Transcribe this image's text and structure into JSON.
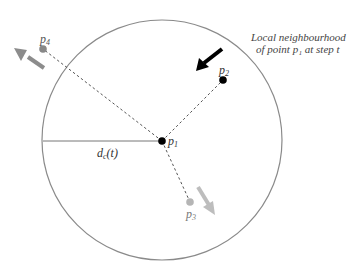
{
  "diagram": {
    "caption_lines": [
      "Local neighbourhood",
      "of point p₁ at step t"
    ],
    "radius_label": {
      "base": "d",
      "sub": "c",
      "rest": "(t)"
    },
    "points": [
      {
        "id": "p1",
        "base": "p",
        "sub": "1",
        "color": "#000000"
      },
      {
        "id": "p2",
        "base": "p",
        "sub": "2",
        "color": "#000000"
      },
      {
        "id": "p3",
        "base": "p",
        "sub": "3",
        "color": "#b5b5b5"
      },
      {
        "id": "p4",
        "base": "p",
        "sub": "4",
        "color": "#888888"
      }
    ],
    "colors": {
      "circle": "#8a8a8a",
      "dashed": "#555555",
      "arrow_p2": "#000000",
      "arrow_p3": "#bdbdbd",
      "arrow_p4": "#8c8c8c"
    }
  }
}
